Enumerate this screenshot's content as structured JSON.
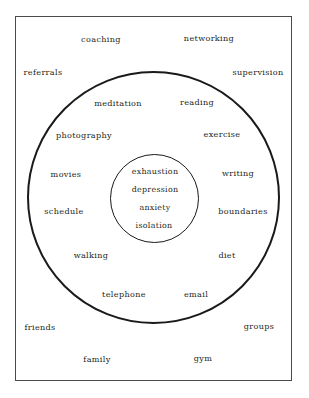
{
  "diagram": {
    "frame": {
      "border_color": "#4a4a4a"
    },
    "rings": [
      {
        "name": "inner-circle",
        "stroke": "#1a1a1a"
      },
      {
        "name": "middle-circle",
        "stroke": "#1a1a1a"
      }
    ],
    "core_words": [
      {
        "label": "exhaustion",
        "x": 155,
        "y": 172
      },
      {
        "label": "depression",
        "x": 155,
        "y": 190
      },
      {
        "label": "anxiety",
        "x": 155,
        "y": 208
      },
      {
        "label": "isolation",
        "x": 154,
        "y": 226
      }
    ],
    "ring_words": [
      {
        "label": "meditation",
        "x": 118,
        "y": 103
      },
      {
        "label": "reading",
        "x": 197,
        "y": 102
      },
      {
        "label": "photography",
        "x": 84,
        "y": 135
      },
      {
        "label": "exercise",
        "x": 222,
        "y": 134
      },
      {
        "label": "movies",
        "x": 66,
        "y": 174
      },
      {
        "label": "writing",
        "x": 238,
        "y": 173
      },
      {
        "label": "schedule",
        "x": 64,
        "y": 211
      },
      {
        "label": "boundaries",
        "x": 243,
        "y": 211
      },
      {
        "label": "walking",
        "x": 91,
        "y": 255
      },
      {
        "label": "diet",
        "x": 227,
        "y": 255
      },
      {
        "label": "telephone",
        "x": 124,
        "y": 294
      },
      {
        "label": "email",
        "x": 196,
        "y": 294
      }
    ],
    "outer_words": [
      {
        "label": "coaching",
        "x": 101,
        "y": 39
      },
      {
        "label": "networking",
        "x": 209,
        "y": 38
      },
      {
        "label": "referrals",
        "x": 43,
        "y": 72
      },
      {
        "label": "supervision",
        "x": 258,
        "y": 72
      },
      {
        "label": "friends",
        "x": 40,
        "y": 327
      },
      {
        "label": "groups",
        "x": 259,
        "y": 326
      },
      {
        "label": "family",
        "x": 97,
        "y": 359
      },
      {
        "label": "gym",
        "x": 203,
        "y": 358
      }
    ]
  }
}
